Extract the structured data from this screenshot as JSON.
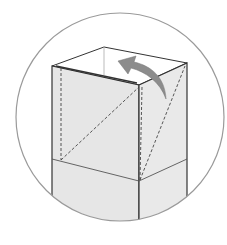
{
  "diagram": {
    "title": "Origami box folding step",
    "colors": {
      "paper": "#e6e6e6",
      "paper_light": "#ececec",
      "line": "#333333",
      "crease": "#555555",
      "circle": "#9a9a9a",
      "arrow": "#8c8c8c",
      "background": "#ffffff"
    },
    "elements": [
      {
        "name": "circle-frame",
        "type": "circle"
      },
      {
        "name": "box-front-face",
        "type": "polygon"
      },
      {
        "name": "box-right-face",
        "type": "polygon"
      },
      {
        "name": "box-top-opening",
        "type": "polygon"
      },
      {
        "name": "valley-fold-dashed-lines",
        "type": "dashed-line"
      },
      {
        "name": "fold-arrow",
        "type": "curved-arrow",
        "direction": "fold back"
      }
    ]
  }
}
